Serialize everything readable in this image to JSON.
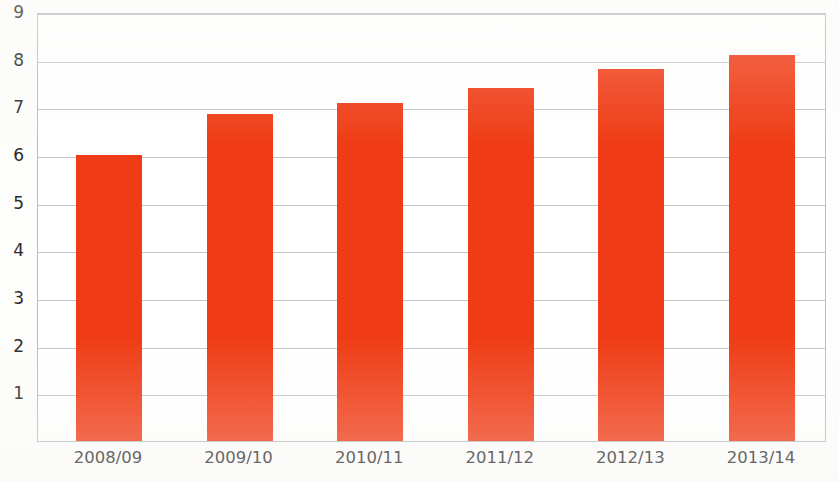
{
  "chart_data": {
    "type": "bar",
    "title": "",
    "subtitle": "",
    "xlabel": "",
    "ylabel": "",
    "categories": [
      "2008/09",
      "2009/10",
      "2010/11",
      "2011/12",
      "2012/13",
      "2013/14"
    ],
    "values": [
      6.0,
      6.85,
      7.1,
      7.4,
      7.8,
      8.1
    ],
    "series": [
      {
        "name": "",
        "values": [
          6.0,
          6.85,
          7.1,
          7.4,
          7.8,
          8.1
        ]
      }
    ],
    "ylim": [
      0,
      9
    ],
    "ytick_labels": [
      "9",
      "8",
      "7",
      "6",
      "5",
      "4",
      "3",
      "2",
      "1"
    ],
    "ytick_values": [
      9,
      8,
      7,
      6,
      5,
      4,
      3,
      2,
      1
    ],
    "grid": true,
    "grid_axis": "y",
    "legend": false,
    "legend_position": "none",
    "bar_color": "#ef3c16",
    "grid_color": "#c2c5c9",
    "axis_border_color": "#b9bcc0",
    "background_color": "#ffffff",
    "annotations": []
  }
}
